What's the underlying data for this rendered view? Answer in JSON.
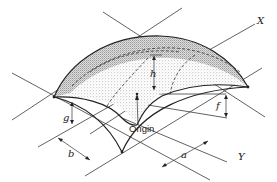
{
  "figure": {
    "type": "isometric shell surface diagram",
    "surface": "doubly curved (elliptic paraboloid) shell over rectangular base, shaded dome",
    "labels": {
      "x_axis": "X",
      "y_axis": "Y",
      "origin": "Origin",
      "h": "h",
      "f": "f",
      "g": "g",
      "a": "a",
      "b": "b"
    },
    "colors": {
      "ink": "#222222",
      "shade": "#9a9a9a",
      "background": "#ffffff"
    }
  }
}
